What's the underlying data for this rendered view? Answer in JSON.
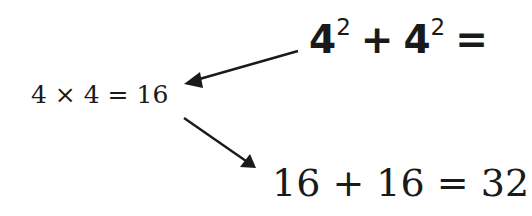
{
  "diagram": {
    "top_equation": {
      "base1": "4",
      "exp1": "2",
      "op": "+",
      "base2": "4",
      "exp2": "2",
      "equals": "="
    },
    "left_equation": "4 × 4 = 16",
    "bottom_equation": "16 + 16 = 32",
    "arrows": [
      {
        "from": "top_equation",
        "to": "left_equation"
      },
      {
        "from": "left_equation",
        "to": "bottom_equation"
      }
    ],
    "colors": {
      "ink": "#1a1a1a",
      "background": "#ffffff"
    }
  }
}
